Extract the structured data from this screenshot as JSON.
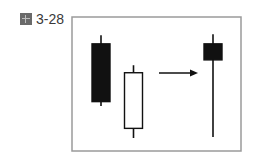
{
  "figure": {
    "label": "3-28",
    "icon": "figure-icon"
  },
  "chart_data": {
    "type": "candlestick",
    "title": "",
    "xlabel": "",
    "ylabel": "",
    "grid": false,
    "legend": "none",
    "note": "Relative price units (0-100, higher = higher price); no axes shown. Two candles combine (arrow) into one.",
    "ylim": [
      0,
      100
    ],
    "candles": [
      {
        "name": "candle-1",
        "color": "black",
        "open": 88,
        "high": 96,
        "low": 30,
        "close": 34
      },
      {
        "name": "candle-2",
        "color": "white",
        "open": 9,
        "high": 68,
        "low": 0,
        "close": 61
      },
      {
        "name": "combined-candle",
        "color": "black",
        "open": 88,
        "high": 97,
        "low": 1,
        "close": 73
      }
    ],
    "annotations": [
      {
        "type": "arrow",
        "direction": "right",
        "from": "candle-2",
        "to": "combined-candle"
      }
    ],
    "colors": {
      "black_body": "#111111",
      "white_body": "#ffffff",
      "frame": "#9a9a9a"
    }
  }
}
